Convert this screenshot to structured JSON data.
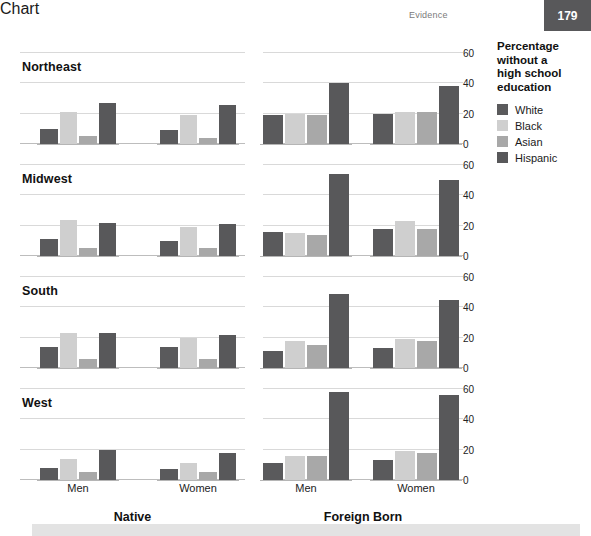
{
  "header": {
    "running_head": "Evidence",
    "page_number": "179"
  },
  "legend": {
    "title_lines": [
      "Percentage",
      "without a",
      "high school",
      "education"
    ],
    "title_text": "Percentage without a high school education",
    "items": [
      {
        "label": "White",
        "color": "#5a5a5c"
      },
      {
        "label": "Black",
        "color": "#cfcfcf"
      },
      {
        "label": "Asian",
        "color": "#a8a8a8"
      },
      {
        "label": "Hispanic",
        "color": "#58585a"
      }
    ]
  },
  "axis": {
    "y_ticks": [
      "0",
      "20",
      "40",
      "60"
    ],
    "y_tick_values": [
      0,
      20,
      40,
      60
    ],
    "ylim": [
      0,
      62
    ],
    "group_labels": [
      "Men",
      "Women"
    ],
    "panel_labels": [
      "Native",
      "Foreign Born"
    ]
  },
  "chart_data": {
    "type": "bar",
    "xlabel": "",
    "ylabel": "Percentage without a high school education",
    "ylim": [
      0,
      62
    ],
    "y_ticks": [
      0,
      20,
      40,
      60
    ],
    "grid": true,
    "legend_position": "right",
    "series": [
      {
        "name": "White",
        "color": "#5a5a5c"
      },
      {
        "name": "Black",
        "color": "#cfcfcf"
      },
      {
        "name": "Asian",
        "color": "#a8a8a8"
      },
      {
        "name": "Hispanic",
        "color": "#58585a"
      }
    ],
    "categories": [
      "White",
      "Black",
      "Asian",
      "Hispanic"
    ],
    "panels": [
      {
        "region": "Northeast",
        "groups": [
          {
            "nativity": "Native",
            "sex": "Men",
            "values": [
              10,
              21,
              5,
              27
            ]
          },
          {
            "nativity": "Native",
            "sex": "Women",
            "values": [
              9,
              19,
              4,
              26
            ]
          },
          {
            "nativity": "Foreign Born",
            "sex": "Men",
            "values": [
              19,
              20,
              19,
              40
            ]
          },
          {
            "nativity": "Foreign Born",
            "sex": "Women",
            "values": [
              20,
              21,
              21,
              38
            ]
          }
        ]
      },
      {
        "region": "Midwest",
        "groups": [
          {
            "nativity": "Native",
            "sex": "Men",
            "values": [
              11,
              24,
              5,
              22
            ]
          },
          {
            "nativity": "Native",
            "sex": "Women",
            "values": [
              10,
              19,
              5,
              21
            ]
          },
          {
            "nativity": "Foreign Born",
            "sex": "Men",
            "values": [
              16,
              15,
              14,
              54
            ]
          },
          {
            "nativity": "Foreign Born",
            "sex": "Women",
            "values": [
              18,
              23,
              18,
              50
            ]
          }
        ]
      },
      {
        "region": "South",
        "groups": [
          {
            "nativity": "Native",
            "sex": "Men",
            "values": [
              14,
              23,
              6,
              23
            ]
          },
          {
            "nativity": "Native",
            "sex": "Women",
            "values": [
              14,
              20,
              6,
              22
            ]
          },
          {
            "nativity": "Foreign Born",
            "sex": "Men",
            "values": [
              11,
              18,
              15,
              49
            ]
          },
          {
            "nativity": "Foreign Born",
            "sex": "Women",
            "values": [
              13,
              19,
              18,
              45
            ]
          }
        ]
      },
      {
        "region": "West",
        "groups": [
          {
            "nativity": "Native",
            "sex": "Men",
            "values": [
              8,
              14,
              5,
              20
            ]
          },
          {
            "nativity": "Native",
            "sex": "Women",
            "values": [
              7,
              11,
              5,
              18
            ]
          },
          {
            "nativity": "Foreign Born",
            "sex": "Men",
            "values": [
              11,
              16,
              16,
              58
            ]
          },
          {
            "nativity": "Foreign Born",
            "sex": "Women",
            "values": [
              13,
              19,
              18,
              56
            ]
          }
        ]
      }
    ]
  }
}
